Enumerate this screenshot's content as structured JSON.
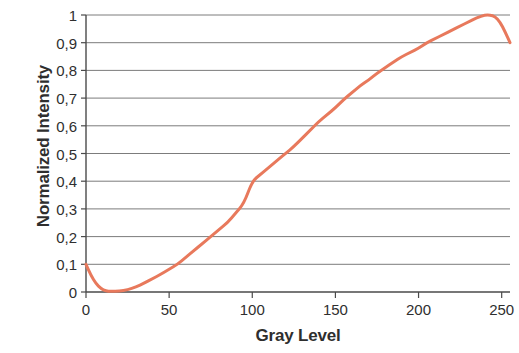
{
  "chart_data": {
    "type": "line",
    "title": "",
    "subtitle": "",
    "xlabel": "Gray Level",
    "ylabel": "Normalized Intensity",
    "xlim": [
      0,
      255
    ],
    "ylim": [
      0,
      1
    ],
    "grid": "horizontal",
    "legend": "none",
    "decimal_separator": ",",
    "xticks": [
      0,
      50,
      100,
      150,
      200,
      250
    ],
    "xtick_labels": [
      "0",
      "50",
      "100",
      "150",
      "200",
      "250"
    ],
    "yticks": [
      0,
      0.1,
      0.2,
      0.3,
      0.4,
      0.5,
      0.6,
      0.7,
      0.8,
      0.9,
      1
    ],
    "ytick_labels": [
      "0",
      "0,1",
      "0,2",
      "0,3",
      "0,4",
      "0,5",
      "0,6",
      "0,7",
      "0,8",
      "0,9",
      "1"
    ],
    "series": [
      {
        "name": "Normalized Intensity",
        "color": "#E8795C",
        "line_width": 3,
        "x": [
          0,
          3,
          6,
          9,
          12,
          15,
          20,
          25,
          30,
          35,
          40,
          45,
          50,
          55,
          60,
          65,
          70,
          75,
          80,
          85,
          90,
          95,
          100,
          105,
          110,
          115,
          120,
          125,
          130,
          135,
          140,
          145,
          150,
          155,
          160,
          165,
          170,
          175,
          180,
          185,
          190,
          195,
          200,
          205,
          210,
          215,
          220,
          225,
          230,
          235,
          240,
          243,
          246,
          249,
          252,
          255
        ],
        "y": [
          0.1,
          0.06,
          0.03,
          0.012,
          0.004,
          0.002,
          0.003,
          0.008,
          0.018,
          0.032,
          0.048,
          0.064,
          0.082,
          0.1,
          0.125,
          0.15,
          0.175,
          0.2,
          0.225,
          0.25,
          0.285,
          0.32,
          0.4,
          0.425,
          0.45,
          0.475,
          0.5,
          0.525,
          0.555,
          0.585,
          0.615,
          0.64,
          0.665,
          0.695,
          0.72,
          0.745,
          0.765,
          0.79,
          0.81,
          0.83,
          0.85,
          0.865,
          0.88,
          0.9,
          0.915,
          0.93,
          0.945,
          0.96,
          0.975,
          0.99,
          1.0,
          1.0,
          0.995,
          0.975,
          0.94,
          0.9
        ]
      }
    ]
  },
  "axis": {
    "ylabel_text": "Normalized Intensity",
    "xlabel_text": "Gray Level"
  }
}
